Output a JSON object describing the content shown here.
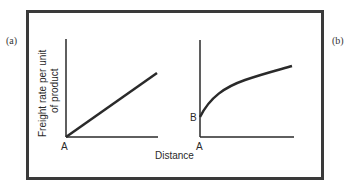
{
  "figure": {
    "panel_a_label": "(a)",
    "panel_b_label": "(b)",
    "y_axis_label_line1": "Freight rate per unit",
    "y_axis_label_line2": "of product",
    "x_axis_label": "Distance",
    "panel_a": {
      "origin_label": "A",
      "curve": "linear, starts at origin A"
    },
    "panel_b": {
      "origin_label": "A",
      "intercept_label": "B",
      "curve": "concave, starts at intercept B, increasing at decreasing rate"
    },
    "colors": {
      "line": "#2a2a2a",
      "frame": "#3a3a3a",
      "background": "#ffffff"
    }
  }
}
